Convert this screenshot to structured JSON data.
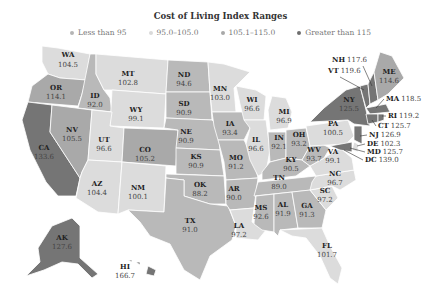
{
  "title": "Cost of Living Index Ranges",
  "legend": [
    {
      "label": "Less than 95",
      "color": "#b5b5b5"
    },
    {
      "label": "95.0–105.0",
      "color": "#d9d9d9"
    },
    {
      "label": "105.1–115.0",
      "color": "#a8a8a8"
    },
    {
      "label": "Greater than 115",
      "color": "#6e6e6e"
    }
  ],
  "colors": {
    "lt95": "#b9b9b9",
    "mid": "#dcdcdc",
    "hi": "#a9a9a9",
    "top": "#757575"
  },
  "states": {
    "WA": "104.5",
    "OR": "114.1",
    "CA": "133.6",
    "ID": "92.0",
    "NV": "105.5",
    "MT": "102.8",
    "WY": "99.1",
    "UT": "96.6",
    "AZ": "104.4",
    "CO": "105.2",
    "NM": "100.1",
    "ND": "94.6",
    "SD": "90.9",
    "NE": "90.9",
    "KS": "90.9",
    "OK": "88.2",
    "TX": "91.0",
    "MN": "103.0",
    "IA": "93.4",
    "MO": "91.2",
    "AR": "90.0",
    "LA": "97.2",
    "WI": "96.6",
    "IL": "96.6",
    "MI": "96.9",
    "IN": "92.1",
    "OH": "93.2",
    "KY": "90.5",
    "TN": "89.0",
    "MS": "92.6",
    "AL": "91.9",
    "GA": "91.3",
    "FL": "101.7",
    "SC": "97.2",
    "NC": "96.7",
    "VA": "99.1",
    "WV": "93.7",
    "PA": "100.5",
    "NY": "125.5",
    "ME": "114.6",
    "NH": "117.6",
    "VT": "119.6",
    "MA": "118.5",
    "RI": "119.2",
    "CT": "125.7",
    "NJ": "126.9",
    "DE": "102.3",
    "MD": "125.7",
    "DC": "139.0",
    "AK": "127.6",
    "HI": "166.7"
  }
}
